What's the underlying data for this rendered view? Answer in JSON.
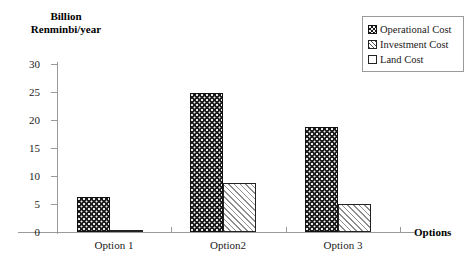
{
  "chart_data": {
    "type": "bar",
    "title": "",
    "ylabel_line1": "Billion",
    "ylabel_line2": "Renminbi/year",
    "xlabel": "Options",
    "categories": [
      "Option 1",
      "Option2",
      "Option 3"
    ],
    "series": [
      {
        "name": "Operational Cost",
        "values": [
          6.3,
          24.9,
          18.8
        ],
        "pattern": "dark-dotted"
      },
      {
        "name": "Investment Cost",
        "values": [
          0.3,
          8.7,
          5.0
        ],
        "pattern": "diagonal-hatch"
      },
      {
        "name": "Land Cost",
        "values": [
          0,
          0,
          0
        ],
        "pattern": "white"
      }
    ],
    "yticks": [
      30,
      25,
      20,
      15,
      10,
      5,
      0
    ],
    "ylim": [
      0,
      30
    ],
    "grid": false,
    "legend_position": "top-right",
    "legend_entries": [
      "Operational Cost",
      "Investment Cost",
      "Land Cost"
    ],
    "colors": {
      "axis": "#9a9a9a",
      "text": "#1a1a1a",
      "operational": "#1b1b1b",
      "investment": "#8d8d8d",
      "land": "#ffffff",
      "background": "#ffffff"
    }
  }
}
